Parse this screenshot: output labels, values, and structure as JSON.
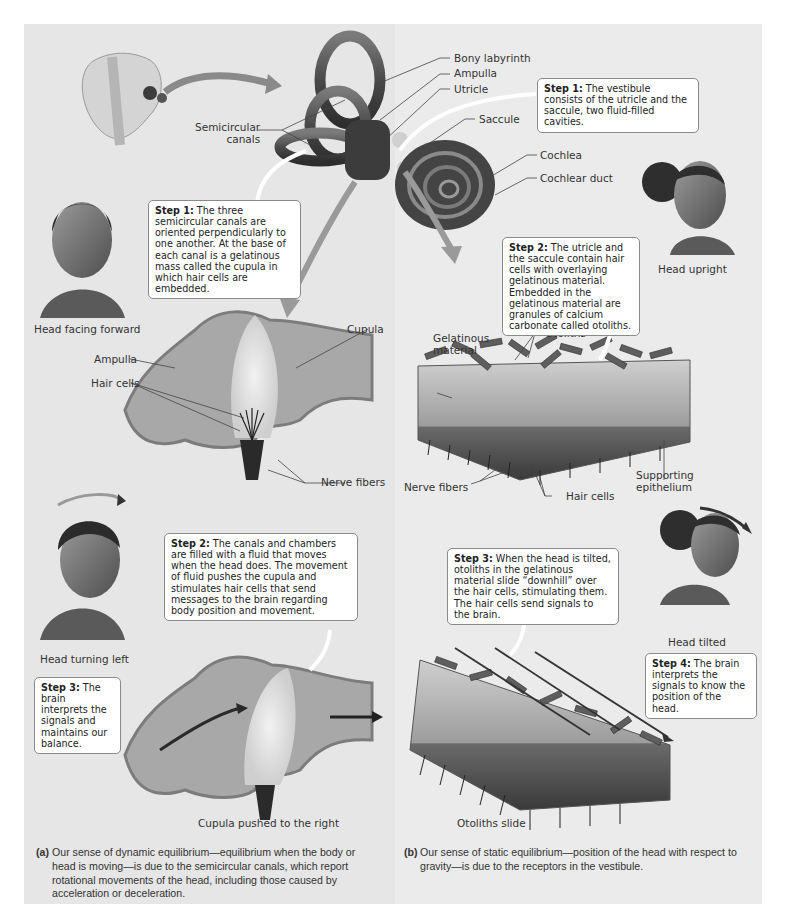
{
  "figure": {
    "panel_a": {
      "labels": {
        "semicircular_canals": "Semicircular\ncanals",
        "head_facing_forward": "Head facing forward",
        "cupula": "Cupula",
        "ampulla": "Ampulla",
        "hair_cells": "Hair cells",
        "nerve_fibers": "Nerve fibers",
        "head_turning_left": "Head turning left",
        "cupula_pushed": "Cupula pushed to the right"
      },
      "steps": [
        {
          "title": "Step 1:",
          "text": " The three semicircular canals are oriented perpendicularly to one another. At the base of each canal is a gelatinous mass called the cupula in which hair cells are embedded."
        },
        {
          "title": "Step 2:",
          "text": " The canals and chambers are filled with a fluid that moves when the head does. The movement of fluid pushes the cupula and stimulates hair cells that send messages to the brain regarding body position and movement."
        },
        {
          "title": "Step 3:",
          "text": " The brain interprets the signals and maintains our balance."
        }
      ],
      "caption_tag": "(a)",
      "caption": "Our sense of dynamic equilibrium—equilibrium when the body or head is moving—is due to the semicircular canals, which report rotational movements of the head, including those caused by acceleration or deceleration."
    },
    "inner_ear_labels": {
      "bony_labyrinth": "Bony labyrinth",
      "ampulla": "Ampulla",
      "utricle": "Utricle",
      "saccule": "Saccule",
      "cochlea": "Cochlea",
      "cochlear_duct": "Cochlear duct"
    },
    "panel_b": {
      "labels": {
        "head_upright": "Head upright",
        "gelatinous_material": "Gelatinous\nmaterial",
        "otoliths": "Otoliths",
        "nerve_fibers": "Nerve fibers",
        "hair_cells": "Hair cells",
        "supporting_epithelium": "Supporting\nepithelium",
        "head_tilted": "Head tilted",
        "otoliths_slide": "Otoliths slide"
      },
      "steps": [
        {
          "title": "Step 1:",
          "text": " The vestibule consists of the utricle and the saccule, two fluid-filled cavities."
        },
        {
          "title": "Step 2:",
          "text": " The utricle and the saccule contain hair cells with overlaying gelatinous material. Embedded in the gelatinous material are granules of calcium carbonate called otoliths."
        },
        {
          "title": "Step 3:",
          "text": " When the head is tilted, otoliths in the gelatinous material slide “downhill” over the hair cells, stimulating them. The hair cells send signals to the brain."
        },
        {
          "title": "Step 4:",
          "text": " The brain interprets the signals to know the position of the head."
        }
      ],
      "caption_tag": "(b)",
      "caption": "Our sense of static equilibrium—position of the head with respect to gravity—is due to the receptors in the vestibule."
    }
  }
}
